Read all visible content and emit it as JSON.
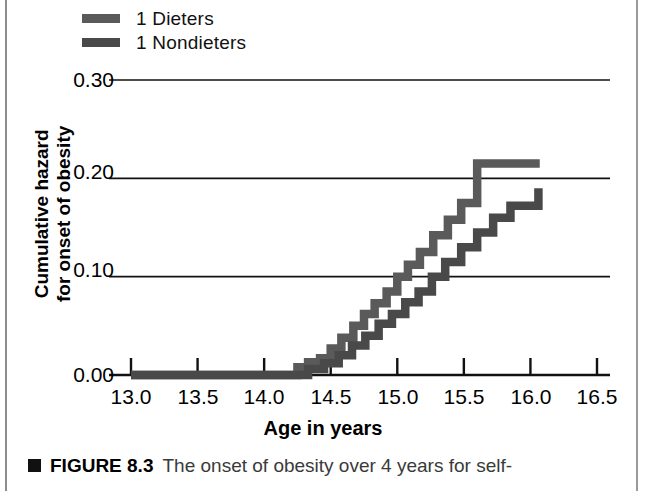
{
  "legend": {
    "items": [
      {
        "label": "1 Dieters",
        "color": "#5a5a5a",
        "swatch_name": "legend-swatch-dieters"
      },
      {
        "label": "1 Nondieters",
        "color": "#494949",
        "swatch_name": "legend-swatch-nondieters"
      }
    ]
  },
  "axes": {
    "y_title_line1": "Cumulative hazard",
    "y_title_line2": "for onset of obesity",
    "x_title": "Age in years",
    "y_ticks": [
      "0.30",
      "0.20",
      "0.10",
      "0.00"
    ],
    "x_ticks": [
      "13.0",
      "13.5",
      "14.0",
      "14.5",
      "15.0",
      "15.5",
      "16.0",
      "16.5"
    ]
  },
  "caption": {
    "marker": "square-marker",
    "figure_number": "FIGURE 8.3",
    "text": "The onset of obesity over 4 years for self-"
  },
  "chart_data": {
    "type": "line",
    "subtype": "step",
    "title": "",
    "xlabel": "Age in years",
    "ylabel": "Cumulative hazard for onset of obesity",
    "xlim": [
      13.0,
      16.5
    ],
    "ylim": [
      0.0,
      0.3
    ],
    "xticks": [
      13.0,
      13.5,
      14.0,
      14.5,
      15.0,
      15.5,
      16.0,
      16.5
    ],
    "yticks": [
      0.0,
      0.1,
      0.2,
      0.3
    ],
    "grid": "horizontal",
    "legend_position": "above-plot-left",
    "series": [
      {
        "name": "1 Dieters",
        "color": "#5a5a5a",
        "x": [
          13.0,
          14.15,
          14.25,
          14.33,
          14.42,
          14.5,
          14.58,
          14.67,
          14.75,
          14.83,
          14.92,
          15.0,
          15.08,
          15.17,
          15.27,
          15.38,
          15.48,
          15.6,
          16.07
        ],
        "y": [
          0.0,
          0.0,
          0.008,
          0.013,
          0.017,
          0.027,
          0.038,
          0.05,
          0.062,
          0.073,
          0.085,
          0.1,
          0.112,
          0.125,
          0.142,
          0.158,
          0.175,
          0.215,
          0.215
        ]
      },
      {
        "name": "1 Nondieters",
        "color": "#494949",
        "x": [
          13.0,
          14.22,
          14.33,
          14.45,
          14.56,
          14.66,
          14.76,
          14.86,
          14.96,
          15.06,
          15.16,
          15.26,
          15.36,
          15.48,
          15.6,
          15.72,
          15.85,
          16.06
        ],
        "y": [
          0.0,
          0.0,
          0.006,
          0.012,
          0.02,
          0.03,
          0.04,
          0.052,
          0.062,
          0.074,
          0.085,
          0.1,
          0.115,
          0.13,
          0.145,
          0.16,
          0.172,
          0.19
        ]
      }
    ]
  }
}
